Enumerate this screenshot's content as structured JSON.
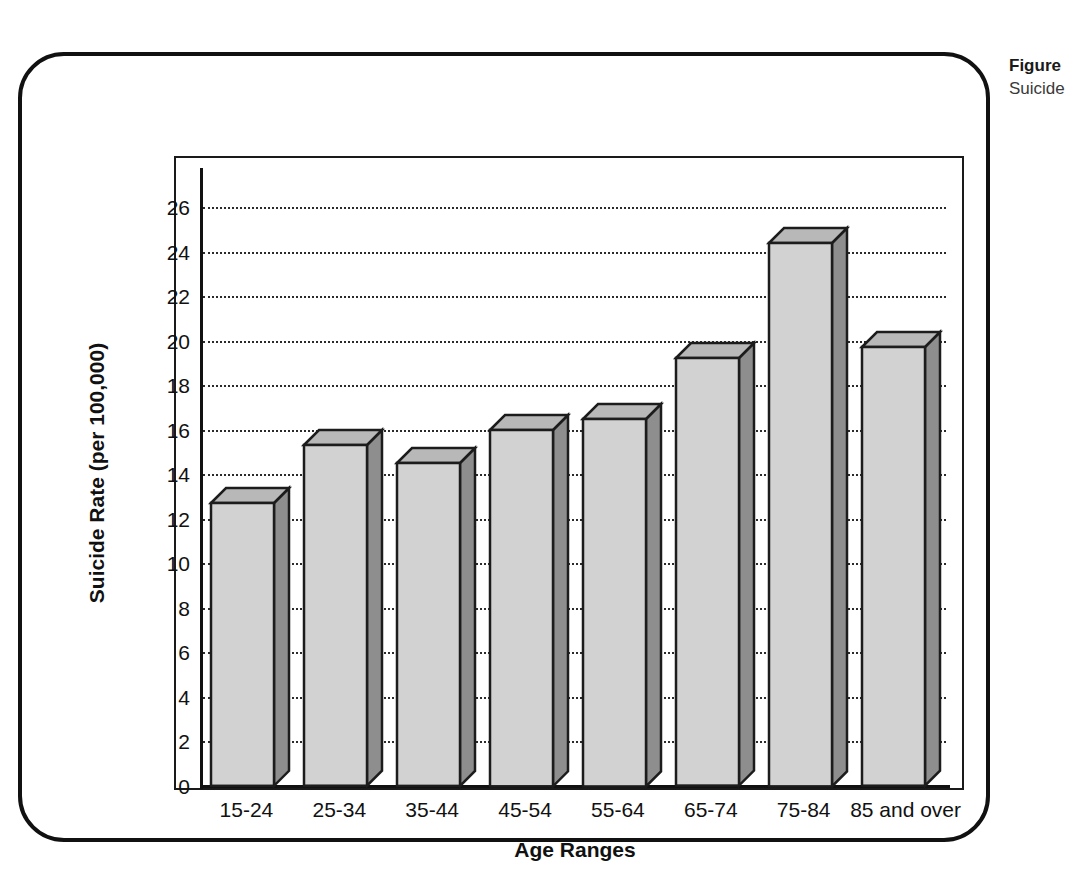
{
  "figure": {
    "caption_title": "Figure",
    "caption_subtitle": "Suicide"
  },
  "chart_data": {
    "type": "bar",
    "title": "",
    "xlabel": "Age Ranges",
    "ylabel": "Suicide Rate (per 100,000)",
    "categories": [
      "15-24",
      "25-34",
      "35-44",
      "45-54",
      "55-64",
      "65-74",
      "75-84",
      "85 and over"
    ],
    "values": [
      12.7,
      15.3,
      14.5,
      16.0,
      16.5,
      19.2,
      24.4,
      19.7
    ],
    "ylim": [
      0,
      27
    ],
    "yticks": [
      0,
      2,
      4,
      6,
      8,
      10,
      12,
      14,
      16,
      18,
      20,
      22,
      24,
      26
    ],
    "ytick_labels": [
      "0",
      "2",
      "4",
      "6",
      "8",
      "10",
      "12",
      "14",
      "16",
      "18",
      "20",
      "22",
      "24",
      "26"
    ],
    "grid": true,
    "grid_style": "dotted",
    "legend": null,
    "bar_style": "3d",
    "colors": {
      "bar_front": "#d2d2d2",
      "bar_side": "#8e8e8e",
      "bar_top": "#b8b8b8",
      "outline": "#1c1c1c",
      "axis": "#111111",
      "grid": "#2b2b2b",
      "background": "#ffffff"
    }
  }
}
